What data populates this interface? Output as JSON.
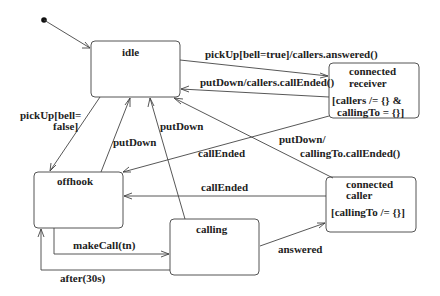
{
  "diagram": {
    "type": "UML state machine",
    "initial_state": "idle",
    "states": [
      {
        "id": "idle",
        "name": "idle",
        "invariant": ""
      },
      {
        "id": "connected_receiver",
        "name_line1": "connected",
        "name_line2": "receiver",
        "invariant_line1": "[callers /= {} &",
        "invariant_line2": "callingTo = {}]"
      },
      {
        "id": "offhook",
        "name": "offhook",
        "invariant": ""
      },
      {
        "id": "calling",
        "name": "calling",
        "invariant": ""
      },
      {
        "id": "connected_caller",
        "name_line1": "connected",
        "name_line2": "caller",
        "invariant": "[callingTo /= {}]"
      }
    ],
    "transitions": [
      {
        "from": "initial",
        "to": "idle",
        "label": ""
      },
      {
        "from": "idle",
        "to": "connected_receiver",
        "label": "pickUp[bell=true]/callers.answered()"
      },
      {
        "from": "connected_receiver",
        "to": "idle",
        "label": "putDown/callers.callEnded()"
      },
      {
        "from": "idle",
        "to": "offhook",
        "label_line1": "pickUp[bell=",
        "label_line2": "false]"
      },
      {
        "from": "offhook",
        "to": "idle",
        "label": "putDown"
      },
      {
        "from": "calling",
        "to": "idle",
        "label": "putDown"
      },
      {
        "from": "connected_caller",
        "to": "idle",
        "label_line1": "putDown/",
        "label_line2": "callingTo.callEnded()"
      },
      {
        "from": "connected_receiver",
        "to": "offhook",
        "label": "callEnded"
      },
      {
        "from": "connected_caller",
        "to": "offhook",
        "label": "callEnded"
      },
      {
        "from": "offhook",
        "to": "calling",
        "label": "makeCall(tn)"
      },
      {
        "from": "calling",
        "to": "offhook",
        "label": "after(30s)"
      },
      {
        "from": "calling",
        "to": "connected_caller",
        "label": "answered"
      }
    ]
  }
}
